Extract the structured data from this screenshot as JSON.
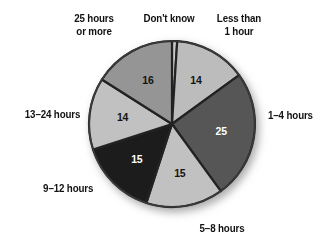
{
  "chart_data": {
    "type": "pie",
    "title": "",
    "subtitle": "",
    "xlabel": "",
    "ylabel": "",
    "legend_position": "none",
    "grid": false,
    "value_unit": "percent",
    "categories": [
      "Don't know",
      "Less than 1 hour",
      "1–4 hours",
      "5–8 hours",
      "9–12 hours",
      "13–24 hours",
      "25 hours or more"
    ],
    "values": [
      1,
      14,
      25,
      15,
      15,
      14,
      16
    ],
    "slices": [
      {
        "label": "Don't know",
        "label_lines": "Don't know",
        "value": null,
        "value_text": "",
        "share": 1,
        "color": "#c9c9c9",
        "value_text_color": "#111111",
        "start_angle": 0,
        "end_angle": 3.6
      },
      {
        "label": "Less than 1 hour",
        "label_lines": "Less than\n1 hour",
        "value": 14,
        "value_text": "14",
        "share": 14,
        "color": "#bcbcbc",
        "value_text_color": "#141414",
        "start_angle": 3.6,
        "end_angle": 54.0
      },
      {
        "label": "1–4 hours",
        "label_lines": "1–4 hours",
        "value": 25,
        "value_text": "25",
        "share": 25,
        "color": "#565656",
        "value_text_color": "#ffffff",
        "start_angle": 54.0,
        "end_angle": 144.0
      },
      {
        "label": "5–8 hours",
        "label_lines": "5–8 hours",
        "value": 15,
        "value_text": "15",
        "share": 15,
        "color": "#c1c1c1",
        "value_text_color": "#141414",
        "start_angle": 144.0,
        "end_angle": 198.0
      },
      {
        "label": "9–12 hours",
        "label_lines": "9–12 hours",
        "value": 15,
        "value_text": "15",
        "share": 15,
        "color": "#1e1e1e",
        "value_text_color": "#ffffff",
        "start_angle": 198.0,
        "end_angle": 252.0
      },
      {
        "label": "13–24 hours",
        "label_lines": "13–24 hours",
        "value": 14,
        "value_text": "14",
        "share": 14,
        "color": "#c1c1c1",
        "value_text_color": "#141414",
        "start_angle": 252.0,
        "end_angle": 302.4
      },
      {
        "label": "25 hours or more",
        "label_lines": "25 hours\nor more",
        "value": 16,
        "value_text": "16",
        "share": 16,
        "color": "#959595",
        "value_text_color": "#141414",
        "start_angle": 302.4,
        "end_angle": 360.0
      }
    ],
    "style": {
      "background": "#ffffff",
      "separator_color": "#242424",
      "outline_color": "#3a3a3a",
      "shadow": true,
      "center_x": 172,
      "center_y": 124,
      "radius": 83
    }
  }
}
